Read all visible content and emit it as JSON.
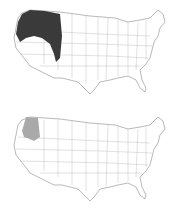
{
  "figure": {
    "panels": [
      {
        "id": "top",
        "description": "United States map with dark shaded region covering Pacific Northwest and northern Great Basin",
        "shade_color": "#3a3a3a"
      },
      {
        "id": "bottom",
        "description": "United States map with light gray shaded region covering Oregon and northeastern California",
        "shade_color": "#a9a9a9"
      }
    ]
  },
  "colors": {
    "background": "#ffffff",
    "outline": "#8a8a8a",
    "state_lines": "#a8a8a8"
  }
}
